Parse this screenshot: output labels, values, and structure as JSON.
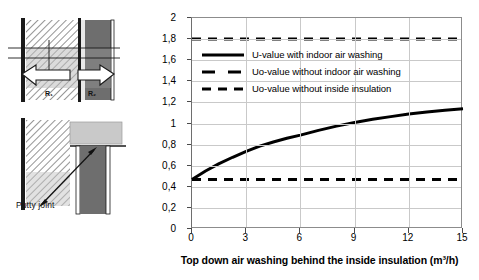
{
  "figure": {
    "diagram_left": {
      "top_drawing_name": "wall-section-top",
      "bottom_drawing_name": "wall-section-bottom",
      "putty_label": "Putty joint",
      "resistance_label_1": "R₁",
      "resistance_label_2": "R₂"
    }
  },
  "chart_data": {
    "type": "line",
    "title": "",
    "xlabel": "Top down air washing behind the inside insulation (m³/h)",
    "ylabel_line1": "Apparent thermal transmittance",
    "ylabel_line2": "(W/(m² K))",
    "xlim": [
      0,
      15
    ],
    "ylim": [
      0,
      2
    ],
    "xticks": [
      0,
      3,
      6,
      9,
      12,
      15
    ],
    "xtick_labels": [
      "0",
      "3",
      "6",
      "9",
      "12",
      "15"
    ],
    "yticks": [
      0,
      0.2,
      0.4,
      0.6,
      0.8,
      1,
      1.2,
      1.4,
      1.6,
      1.8,
      2
    ],
    "ytick_labels": [
      "0",
      "0,2",
      "0,4",
      "0,6",
      "0,8",
      "1",
      "1,2",
      "1,4",
      "1,6",
      "1,8",
      "2"
    ],
    "grid": true,
    "legend_position": "upper-left-inside",
    "series": [
      {
        "name": "U-value with indoor air washing",
        "style": "solid",
        "color": "#000000",
        "x": [
          0,
          0.75,
          1.5,
          2.25,
          3,
          3.75,
          4.5,
          5.25,
          6,
          7,
          8,
          9,
          10,
          11,
          12,
          13,
          14,
          15
        ],
        "values": [
          0.47,
          0.55,
          0.62,
          0.68,
          0.735,
          0.785,
          0.825,
          0.86,
          0.89,
          0.935,
          0.975,
          1.01,
          1.04,
          1.065,
          1.09,
          1.11,
          1.125,
          1.14
        ]
      },
      {
        "name": "Uo-value without indoor air washing",
        "style": "dashed",
        "color": "#000000",
        "x": [
          0,
          15
        ],
        "values": [
          0.47,
          0.47
        ]
      },
      {
        "name": "Uo-value without inside insulation",
        "style": "dashed",
        "color": "#000000",
        "x": [
          0,
          15
        ],
        "values": [
          1.8,
          1.8
        ]
      }
    ],
    "legend": [
      "U-value with indoor air washing",
      "Uo-value without indoor air washing",
      "Uo-value without inside insulation"
    ]
  }
}
